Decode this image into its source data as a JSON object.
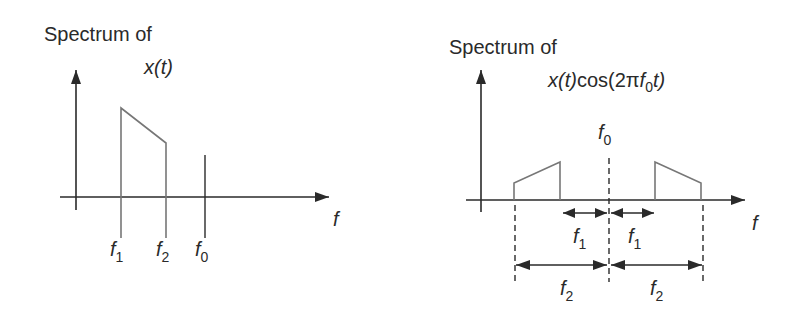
{
  "left_panel": {
    "title_line1": "Spectrum of",
    "title_line2": "x(t)",
    "x_axis_label": "f",
    "tick_labels": [
      {
        "base": "f",
        "sub": "1"
      },
      {
        "base": "f",
        "sub": "2"
      },
      {
        "base": "f",
        "sub": "0"
      }
    ]
  },
  "right_panel": {
    "title_line1": "Spectrum of",
    "title_line2_prefix": "x(t)",
    "title_line2_cos": "cos(2π",
    "title_line2_f": "f",
    "title_line2_sub": "0",
    "title_line2_suffix": "t)",
    "x_axis_label": "f",
    "center_label": {
      "base": "f",
      "sub": "0"
    },
    "dimension_labels": [
      {
        "base": "f",
        "sub": "1"
      },
      {
        "base": "f",
        "sub": "1"
      },
      {
        "base": "f",
        "sub": "2"
      },
      {
        "base": "f",
        "sub": "2"
      }
    ]
  },
  "colors": {
    "axis": "#2a2a2a",
    "spectrum_line": "#777777",
    "text": "#2a2a2a"
  }
}
